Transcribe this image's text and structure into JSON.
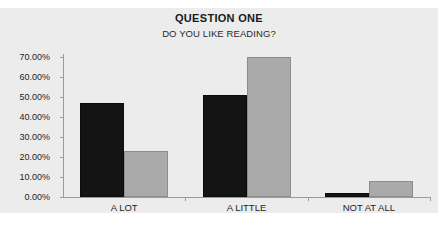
{
  "chart_data": {
    "type": "bar",
    "title": "QUESTION ONE",
    "subtitle": "DO YOU LIKE READING?",
    "xlabel": "",
    "ylabel": "",
    "categories": [
      "A LOT",
      "A LITTLE",
      "NOT AT ALL"
    ],
    "series": [
      {
        "name": "Series 1",
        "color": "#141414",
        "values": [
          47,
          51,
          2
        ]
      },
      {
        "name": "Series 2",
        "color": "#aaaaaa",
        "values": [
          23,
          70,
          8
        ]
      }
    ],
    "ylim": [
      0,
      70
    ],
    "ytick_values": [
      0,
      10,
      20,
      30,
      40,
      50,
      60,
      70
    ],
    "ytick_labels": [
      "0.00%",
      "10.00%",
      "20.00%",
      "30.00%",
      "40.00%",
      "50.00%",
      "60.00%",
      "70.00%"
    ],
    "grid": false,
    "legend": "none",
    "value_format": "percent"
  },
  "colors": {
    "chart_background": "#ececec",
    "page_background": "#ffffff",
    "axis": "#9a9a9a",
    "text": "#1f1f1f",
    "series_dark": "#141414",
    "series_light": "#aaaaaa"
  }
}
